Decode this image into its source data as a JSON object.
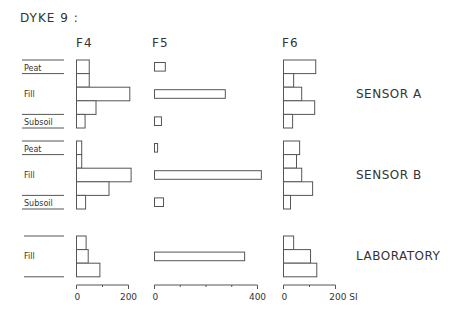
{
  "chart_data": {
    "type": "bar",
    "orientation": "horizontal",
    "title": "DYKE 9 :",
    "unit": "SI",
    "panels": [
      {
        "name": "F4",
        "xlim": [
          0,
          200
        ],
        "ticks": [
          0,
          100,
          200
        ],
        "tick_labels": [
          "0",
          "",
          "200"
        ]
      },
      {
        "name": "F5",
        "xlim": [
          0,
          400
        ],
        "ticks": [
          0,
          100,
          200,
          300,
          400
        ],
        "tick_labels": [
          "0",
          "",
          "",
          "",
          "400"
        ]
      },
      {
        "name": "F6",
        "xlim": [
          0,
          200
        ],
        "ticks": [
          0,
          100,
          200
        ],
        "tick_labels": [
          "0",
          "",
          "200 SI"
        ]
      }
    ],
    "groups": [
      {
        "name": "SENSOR A",
        "layers": [
          {
            "label": "Peat",
            "rows": 1
          },
          {
            "label": "Fill",
            "rows": 3
          },
          {
            "label": "Subsoil",
            "rows": 1
          }
        ],
        "values": {
          "F4": [
            49,
            49,
            205,
            75,
            33
          ],
          "F5": [
            42,
            null,
            275,
            null,
            27
          ],
          "F6": [
            124,
            39,
            70,
            120,
            35
          ]
        }
      },
      {
        "name": "SENSOR B",
        "layers": [
          {
            "label": "Peat",
            "rows": 1
          },
          {
            "label": "Fill",
            "rows": 3
          },
          {
            "label": "Subsoil",
            "rows": 1
          }
        ],
        "values": {
          "F4": [
            20,
            20,
            210,
            125,
            35
          ],
          "F5": [
            12,
            null,
            415,
            null,
            35
          ],
          "F6": [
            62,
            50,
            70,
            112,
            27
          ]
        }
      },
      {
        "name": "LABORATORY",
        "layers": [
          {
            "label": "Fill",
            "rows": 3
          }
        ],
        "values": {
          "F4": [
            37,
            45,
            90
          ],
          "F5": [
            null,
            350,
            null
          ],
          "F6": [
            39,
            104,
            128
          ]
        }
      }
    ]
  }
}
